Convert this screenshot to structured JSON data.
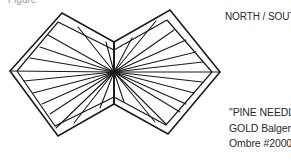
{
  "header": {
    "corner_text": "Figure"
  },
  "diagram": {
    "title": "NORTH / SOUTH",
    "caption": {
      "line1": "\"PINE NEEDLE\"",
      "line2": "GOLD Balger",
      "line3": "Ombre #2000"
    },
    "stroke_color": "#1a1a1a",
    "center": [
      114,
      72
    ],
    "left_shape": [
      [
        114,
        42
      ],
      [
        62,
        13
      ],
      [
        10,
        71
      ],
      [
        58,
        136
      ],
      [
        114,
        104
      ]
    ],
    "right_shape": [
      [
        114,
        42
      ],
      [
        170,
        10
      ],
      [
        220,
        72
      ],
      [
        168,
        134
      ],
      [
        114,
        104
      ]
    ]
  }
}
